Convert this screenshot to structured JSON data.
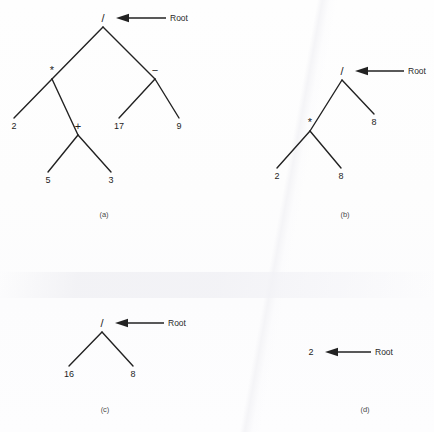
{
  "figure": {
    "background_color": "#fdfdfd",
    "stroke_color": "#222222",
    "text_color": "#1d1d1d",
    "root_pointer_label": "Root"
  },
  "panels": [
    {
      "id": "a",
      "caption": "(a)",
      "caption_pos": {
        "x": 104,
        "y": 215
      },
      "root_pointer": {
        "label": "Root",
        "label_pos": {
          "x": 170,
          "y": 18
        },
        "arrow_from": {
          "x": 166,
          "y": 18
        },
        "arrow_to": {
          "x": 116,
          "y": 18
        }
      },
      "nodes": [
        {
          "name": "root",
          "label": "/",
          "kind": "operator",
          "x": 103,
          "y": 18,
          "anchor": {
            "x": 103,
            "y": 27
          }
        },
        {
          "name": "left-mul",
          "label": "*",
          "kind": "operator",
          "x": 52,
          "y": 70,
          "anchor": {
            "x": 52,
            "y": 79
          }
        },
        {
          "name": "right-sub",
          "label": "−",
          "kind": "operator",
          "x": 155,
          "y": 70,
          "anchor": {
            "x": 155,
            "y": 79
          }
        },
        {
          "name": "leaf-2",
          "label": "2",
          "kind": "value",
          "x": 14,
          "y": 126,
          "anchor": {
            "x": 14,
            "y": 118
          }
        },
        {
          "name": "add",
          "label": "+",
          "kind": "operator",
          "x": 78,
          "y": 126,
          "anchor": {
            "x": 78,
            "y": 135
          }
        },
        {
          "name": "leaf-17",
          "label": "17",
          "kind": "value",
          "x": 119,
          "y": 126,
          "anchor": {
            "x": 119,
            "y": 118
          }
        },
        {
          "name": "leaf-9",
          "label": "9",
          "kind": "value",
          "x": 179,
          "y": 126,
          "anchor": {
            "x": 179,
            "y": 118
          }
        },
        {
          "name": "leaf-5",
          "label": "5",
          "kind": "value",
          "x": 48,
          "y": 180,
          "anchor": {
            "x": 48,
            "y": 172
          }
        },
        {
          "name": "leaf-3",
          "label": "3",
          "kind": "value",
          "x": 111,
          "y": 180,
          "anchor": {
            "x": 111,
            "y": 172
          }
        }
      ],
      "edges": [
        {
          "from": "root",
          "to": "left-mul"
        },
        {
          "from": "root",
          "to": "right-sub"
        },
        {
          "from": "left-mul",
          "to": "leaf-2"
        },
        {
          "from": "left-mul",
          "to": "add"
        },
        {
          "from": "right-sub",
          "to": "leaf-17"
        },
        {
          "from": "right-sub",
          "to": "leaf-9"
        },
        {
          "from": "add",
          "to": "leaf-5"
        },
        {
          "from": "add",
          "to": "leaf-3"
        }
      ],
      "expression": "2 * (5 + 3) / (17 - 9)"
    },
    {
      "id": "b",
      "caption": "(b)",
      "caption_pos": {
        "x": 345,
        "y": 215
      },
      "root_pointer": {
        "label": "Root",
        "label_pos": {
          "x": 408,
          "y": 71
        },
        "arrow_from": {
          "x": 404,
          "y": 71
        },
        "arrow_to": {
          "x": 355,
          "y": 71
        }
      },
      "nodes": [
        {
          "name": "root",
          "label": "/",
          "kind": "operator",
          "x": 342,
          "y": 71,
          "anchor": {
            "x": 342,
            "y": 80
          }
        },
        {
          "name": "mul",
          "label": "*",
          "kind": "operator",
          "x": 310,
          "y": 122,
          "anchor": {
            "x": 310,
            "y": 131
          }
        },
        {
          "name": "leaf-8-r",
          "label": "8",
          "kind": "value",
          "x": 374,
          "y": 122,
          "anchor": {
            "x": 374,
            "y": 114
          }
        },
        {
          "name": "leaf-2",
          "label": "2",
          "kind": "value",
          "x": 277,
          "y": 176,
          "anchor": {
            "x": 277,
            "y": 168
          }
        },
        {
          "name": "leaf-8-l",
          "label": "8",
          "kind": "value",
          "x": 341,
          "y": 176,
          "anchor": {
            "x": 341,
            "y": 168
          }
        }
      ],
      "edges": [
        {
          "from": "root",
          "to": "mul"
        },
        {
          "from": "root",
          "to": "leaf-8-r"
        },
        {
          "from": "mul",
          "to": "leaf-2"
        },
        {
          "from": "mul",
          "to": "leaf-8-l"
        }
      ],
      "expression": "2 * 8 / 8"
    },
    {
      "id": "c",
      "caption": "(c)",
      "caption_pos": {
        "x": 105,
        "y": 410
      },
      "root_pointer": {
        "label": "Root",
        "label_pos": {
          "x": 168,
          "y": 323
        },
        "arrow_from": {
          "x": 164,
          "y": 323
        },
        "arrow_to": {
          "x": 115,
          "y": 323
        }
      },
      "nodes": [
        {
          "name": "root",
          "label": "/",
          "kind": "operator",
          "x": 102,
          "y": 323,
          "anchor": {
            "x": 102,
            "y": 332
          }
        },
        {
          "name": "leaf-16",
          "label": "16",
          "kind": "value",
          "x": 69,
          "y": 374,
          "anchor": {
            "x": 69,
            "y": 366
          }
        },
        {
          "name": "leaf-8",
          "label": "8",
          "kind": "value",
          "x": 133,
          "y": 374,
          "anchor": {
            "x": 133,
            "y": 366
          }
        }
      ],
      "edges": [
        {
          "from": "root",
          "to": "leaf-16"
        },
        {
          "from": "root",
          "to": "leaf-8"
        }
      ],
      "expression": "16 / 8"
    },
    {
      "id": "d",
      "caption": "(d)",
      "caption_pos": {
        "x": 365,
        "y": 410
      },
      "root_pointer": {
        "label": "Root",
        "label_pos": {
          "x": 375,
          "y": 352
        },
        "arrow_from": {
          "x": 371,
          "y": 352
        },
        "arrow_to": {
          "x": 325,
          "y": 352
        }
      },
      "nodes": [
        {
          "name": "root",
          "label": "2",
          "kind": "value",
          "x": 311,
          "y": 352,
          "anchor": {
            "x": 311,
            "y": 352
          }
        }
      ],
      "edges": [],
      "expression": "2"
    }
  ]
}
